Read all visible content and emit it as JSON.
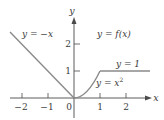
{
  "diagram": {
    "axes": {
      "x_label": "x",
      "y_label": "y",
      "x_ticks": [
        {
          "value": -2,
          "label": "−2"
        },
        {
          "value": -1,
          "label": "−1"
        },
        {
          "value": 0,
          "label": "0"
        },
        {
          "value": 1,
          "label": "1"
        },
        {
          "value": 2,
          "label": "2"
        }
      ],
      "y_ticks": [
        {
          "value": 1,
          "label": "1"
        },
        {
          "value": 2,
          "label": "2"
        }
      ]
    },
    "labels": {
      "neg_x": "y = −x",
      "f_of_x": "y = f(x)",
      "one": "y = 1",
      "x_sq_base": "y = x",
      "x_sq_exp": "2"
    },
    "pieces": [
      {
        "formula": "y = -x",
        "domain": "x < 0"
      },
      {
        "formula": "y = x^2",
        "domain": "0 <= x <= 1"
      },
      {
        "formula": "y = 1",
        "domain": "x > 1"
      }
    ],
    "colors": {
      "curve": "#8a8a8a",
      "axis": "#4a4a4a",
      "text": "#3a3a3a"
    }
  }
}
